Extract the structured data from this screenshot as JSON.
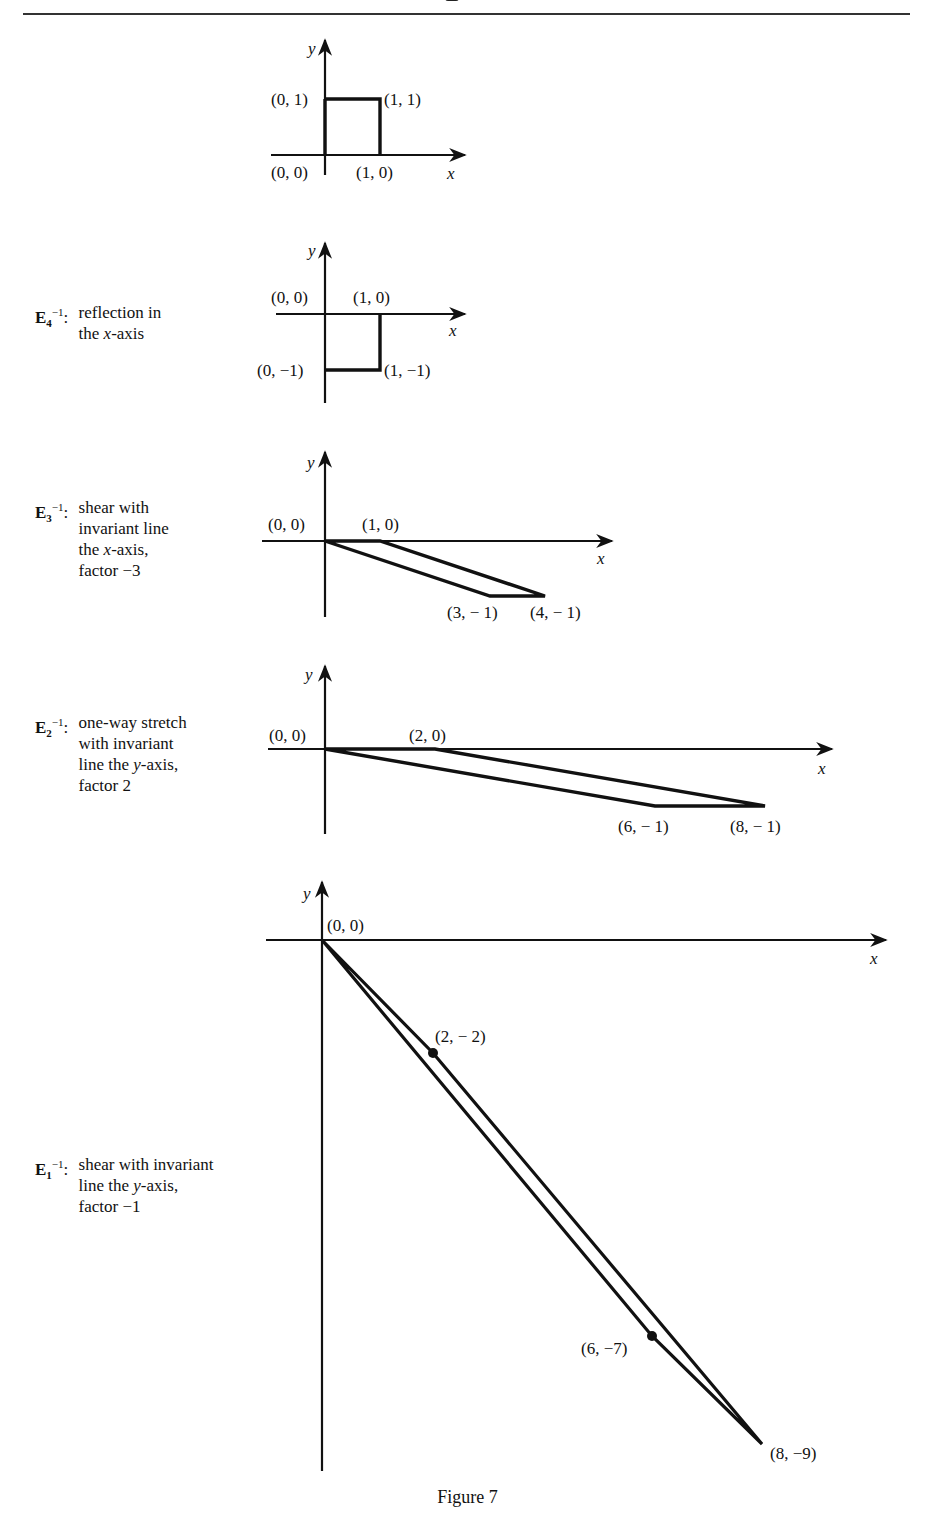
{
  "figure": {
    "caption": "Figure 7",
    "axis_labels": {
      "x": "x",
      "y": "y"
    },
    "panels": [
      {
        "id": "original",
        "description": null,
        "shape": "unit square",
        "vertices": [
          [
            0,
            0
          ],
          [
            1,
            0
          ],
          [
            1,
            1
          ],
          [
            0,
            1
          ]
        ],
        "point_labels": [
          "(0, 1)",
          "(1, 1)",
          "(0, 0)",
          "(1, 0)"
        ]
      },
      {
        "id": "E4_inverse",
        "operator": "E",
        "subscript": "4",
        "superscript": "−1",
        "description_lines": [
          "reflection in",
          "the x-axis"
        ],
        "vertices": [
          [
            0,
            0
          ],
          [
            1,
            0
          ],
          [
            1,
            -1
          ],
          [
            0,
            -1
          ]
        ],
        "point_labels": [
          "(0, 0)",
          "(1, 0)",
          "(0, −1)",
          "(1, −1)"
        ]
      },
      {
        "id": "E3_inverse",
        "operator": "E",
        "subscript": "3",
        "superscript": "−1",
        "description_lines": [
          "shear with",
          "invariant line",
          "the x-axis,",
          "factor −3"
        ],
        "vertices": [
          [
            0,
            0
          ],
          [
            1,
            0
          ],
          [
            4,
            -1
          ],
          [
            3,
            -1
          ]
        ],
        "point_labels": [
          "(0, 0)",
          "(1, 0)",
          "(3, − 1)",
          "(4, − 1)"
        ]
      },
      {
        "id": "E2_inverse",
        "operator": "E",
        "subscript": "2",
        "superscript": "−1",
        "description_lines": [
          "one-way stretch",
          "with invariant",
          "line the y-axis,",
          "factor 2"
        ],
        "vertices": [
          [
            0,
            0
          ],
          [
            2,
            0
          ],
          [
            8,
            -1
          ],
          [
            6,
            -1
          ]
        ],
        "point_labels": [
          "(0, 0)",
          "(2, 0)",
          "(6, − 1)",
          "(8, − 1)"
        ]
      },
      {
        "id": "E1_inverse",
        "operator": "E",
        "subscript": "1",
        "superscript": "−1",
        "description_lines": [
          "shear with invariant",
          "line the y-axis,",
          "factor −1"
        ],
        "vertices": [
          [
            0,
            0
          ],
          [
            2,
            -2
          ],
          [
            8,
            -9
          ],
          [
            6,
            -7
          ]
        ],
        "point_labels": [
          "(0, 0)",
          "(2, − 2)",
          "(6, −7)",
          "(8, −9)"
        ]
      }
    ]
  },
  "labels": {
    "p1": {
      "a": "(0, 1)",
      "b": "(1, 1)",
      "c": "(0, 0)",
      "d": "(1, 0)"
    },
    "p2": {
      "a": "(0, 0)",
      "b": "(1, 0)",
      "c": "(0, −1)",
      "d": "(1, −1)"
    },
    "p3": {
      "a": "(0, 0)",
      "b": "(1, 0)",
      "c": "(3, − 1)",
      "d": "(4, − 1)"
    },
    "p4": {
      "a": "(0, 0)",
      "b": "(2, 0)",
      "c": "(6, − 1)",
      "d": "(8, − 1)"
    },
    "p5": {
      "a": "(0, 0)",
      "b": "(2, − 2)",
      "c": "(6, −7)",
      "d": "(8, −9)"
    },
    "x": "x",
    "y": "y"
  },
  "descriptions": {
    "e4": {
      "op": "E",
      "sub": "4",
      "sup": "−1",
      "colon": ":",
      "line1": "reflection in",
      "line2a": "the ",
      "line2var": "x",
      "line2b": "-axis"
    },
    "e3": {
      "op": "E",
      "sub": "3",
      "sup": "−1",
      "colon": ":",
      "line1": "shear with",
      "line2": "invariant line",
      "line3a": "the ",
      "line3var": "x",
      "line3b": "-axis,",
      "line4": "factor −3"
    },
    "e2": {
      "op": "E",
      "sub": "2",
      "sup": "−1",
      "colon": ":",
      "line1": "one-way stretch",
      "line2": "with invariant",
      "line3a": "line the ",
      "line3var": "y",
      "line3b": "-axis,",
      "line4": "factor 2"
    },
    "e1": {
      "op": "E",
      "sub": "1",
      "sup": "−1",
      "colon": ":",
      "line1": "shear with invariant",
      "line2a": "line the ",
      "line2var": "y",
      "line2b": "-axis,",
      "line3": "factor −1"
    }
  }
}
